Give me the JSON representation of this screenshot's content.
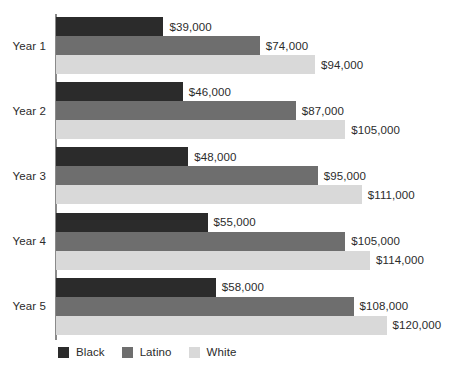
{
  "chart_data": {
    "type": "bar",
    "orientation": "horizontal",
    "title": "",
    "subtitle": "",
    "xlabel": "",
    "ylabel": "",
    "grid": false,
    "legend_position": "bottom-left",
    "xlim": [
      0,
      120000
    ],
    "value_prefix": "$",
    "categories": [
      "Year 1",
      "Year 2",
      "Year 3",
      "Year 4",
      "Year 5"
    ],
    "series": [
      {
        "name": "Black",
        "color": "#2b2b2b",
        "values": [
          39000,
          46000,
          48000,
          55000,
          58000
        ],
        "labels": [
          "$39,000",
          "$46,000",
          "$48,000",
          "$55,000",
          "$58,000"
        ]
      },
      {
        "name": "Latino",
        "color": "#6e6e6e",
        "values": [
          74000,
          87000,
          95000,
          105000,
          108000
        ],
        "labels": [
          "$74,000",
          "$87,000",
          "$95,000",
          "$105,000",
          "$108,000"
        ]
      },
      {
        "name": "White",
        "color": "#d9d9d9",
        "values": [
          94000,
          105000,
          111000,
          114000,
          120000
        ],
        "labels": [
          "$94,000",
          "$105,000",
          "$111,000",
          "$114,000",
          "$120,000"
        ]
      }
    ]
  },
  "axis": {
    "color": "#8a8a8a"
  }
}
